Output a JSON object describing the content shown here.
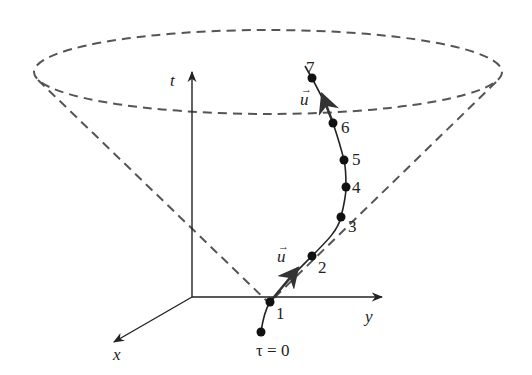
{
  "diagram": {
    "axes": {
      "t_label": "t",
      "x_label": "x",
      "y_label": "y"
    },
    "vector_label": "u",
    "tau_label": "τ = 0",
    "points": [
      {
        "label": "0",
        "x": 261,
        "y": 332
      },
      {
        "label": "1",
        "x": 270,
        "y": 302
      },
      {
        "label": "2",
        "x": 312,
        "y": 256
      },
      {
        "label": "3",
        "x": 341,
        "y": 217
      },
      {
        "label": "4",
        "x": 346,
        "y": 187
      },
      {
        "label": "5",
        "x": 344,
        "y": 160
      },
      {
        "label": "6",
        "x": 333,
        "y": 123
      },
      {
        "label": "7",
        "x": 312,
        "y": 78
      }
    ],
    "colors": {
      "line": "#222222",
      "dashed": "#555555"
    }
  }
}
